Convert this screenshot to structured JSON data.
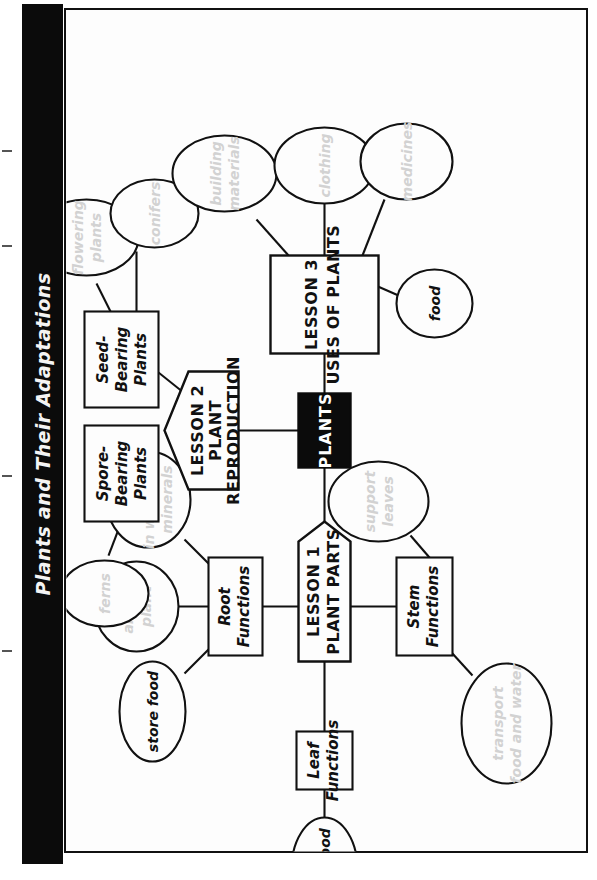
{
  "page": {
    "title": "Plants and Their Adaptations",
    "orientation": "rotated-90-ccw",
    "colors": {
      "title_bar": "#0b0b0b",
      "title_text": "#f4f4f4",
      "paper": "#fdfdfd",
      "ink": "#111111",
      "faded_text": "#d2d2d2"
    }
  },
  "diagram": {
    "type": "concept-map",
    "center": {
      "label": "PLANTS",
      "style": "black-box-white-text"
    },
    "branches": [
      {
        "id": "lesson1",
        "label": "LESSON 1\nPLANT PARTS",
        "line1": "LESSON 1",
        "line2": "PLANT PARTS",
        "shape": "pentagon-arrow",
        "children": [
          {
            "id": "root-functions",
            "label": "Root\nFunctions",
            "line1": "Root",
            "line2": "Functions",
            "shape": "rect",
            "children": [
              {
                "id": "take-in-water",
                "line1": "take",
                "line2": "in water and",
                "line3": "minerals",
                "shape": "ellipse",
                "faded": true
              },
              {
                "id": "anchor-plant",
                "line1": "anchor",
                "line2": "plant",
                "shape": "ellipse",
                "faded": true
              },
              {
                "id": "store-food",
                "line1": "store food",
                "shape": "ellipse",
                "faded": false
              }
            ]
          },
          {
            "id": "stem-functions",
            "label": "Stem\nFunctions",
            "line1": "Stem",
            "line2": "Functions",
            "shape": "rect",
            "children": [
              {
                "id": "support-leaves",
                "line1": "support",
                "line2": "leaves",
                "shape": "ellipse",
                "faded": true
              },
              {
                "id": "transport-food-water",
                "line1": "transport",
                "line2": "food and water",
                "shape": "ellipse",
                "faded": true
              }
            ]
          },
          {
            "id": "leaf-functions",
            "label": "Leaf\nFunctions",
            "line1": "Leaf",
            "line2": "Functions",
            "shape": "rect",
            "children": [
              {
                "id": "make-food",
                "line1": "make food",
                "shape": "ellipse",
                "faded": false
              }
            ]
          }
        ]
      },
      {
        "id": "lesson2",
        "label": "LESSON 2\nPLANT REPRODUCTION",
        "line1": "LESSON 2",
        "line2": "PLANT",
        "line3": "REPRODUCTION",
        "shape": "pentagon-arrow",
        "children": [
          {
            "id": "spore-bearing-plants",
            "line1": "Spore-",
            "line2": "Bearing",
            "line3": "Plants",
            "shape": "rect",
            "children": [
              {
                "id": "ferns",
                "line1": "ferns",
                "shape": "ellipse",
                "faded": true
              }
            ]
          },
          {
            "id": "seed-bearing-plants",
            "line1": "Seed-",
            "line2": "Bearing",
            "line3": "Plants",
            "shape": "rect",
            "children": [
              {
                "id": "flowering-plants",
                "line1": "flowering",
                "line2": "plants",
                "shape": "ellipse",
                "faded": true
              },
              {
                "id": "conifers",
                "line1": "conifers",
                "shape": "ellipse",
                "faded": true
              }
            ]
          }
        ]
      },
      {
        "id": "lesson3",
        "label": "LESSON 3\nUSES OF PLANTS",
        "line1": "LESSON 3",
        "line2": "USES OF PLANTS",
        "shape": "rect",
        "children": [
          {
            "id": "building-materials",
            "line1": "building",
            "line2": "materials",
            "shape": "ellipse",
            "faded": true
          },
          {
            "id": "clothing",
            "line1": "clothing",
            "shape": "ellipse",
            "faded": true
          },
          {
            "id": "medicines",
            "line1": "medicines",
            "shape": "ellipse",
            "faded": true
          },
          {
            "id": "food",
            "line1": "food",
            "shape": "ellipse",
            "faded": false
          }
        ]
      }
    ]
  }
}
